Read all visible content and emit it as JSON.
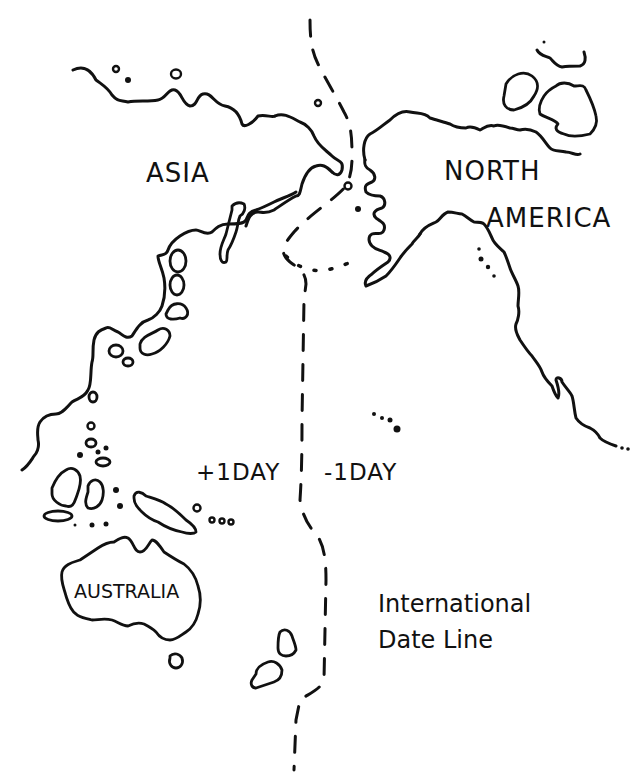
{
  "map": {
    "title": "International Date Line",
    "colors": {
      "ink": "#111111",
      "paper": "#ffffff"
    },
    "labels": {
      "asia": "ASIA",
      "north_america_line1": "NORTH",
      "north_america_line2": "AMERICA",
      "australia": "AUSTRALIA",
      "plus_day": "+1DAY",
      "minus_day": "-1DAY",
      "legend_line1": "International",
      "legend_line2": "Date Line"
    },
    "features": [
      "asia-coastline",
      "north-america-coastline",
      "australia-outline",
      "pacific-islands",
      "international-date-line"
    ]
  }
}
